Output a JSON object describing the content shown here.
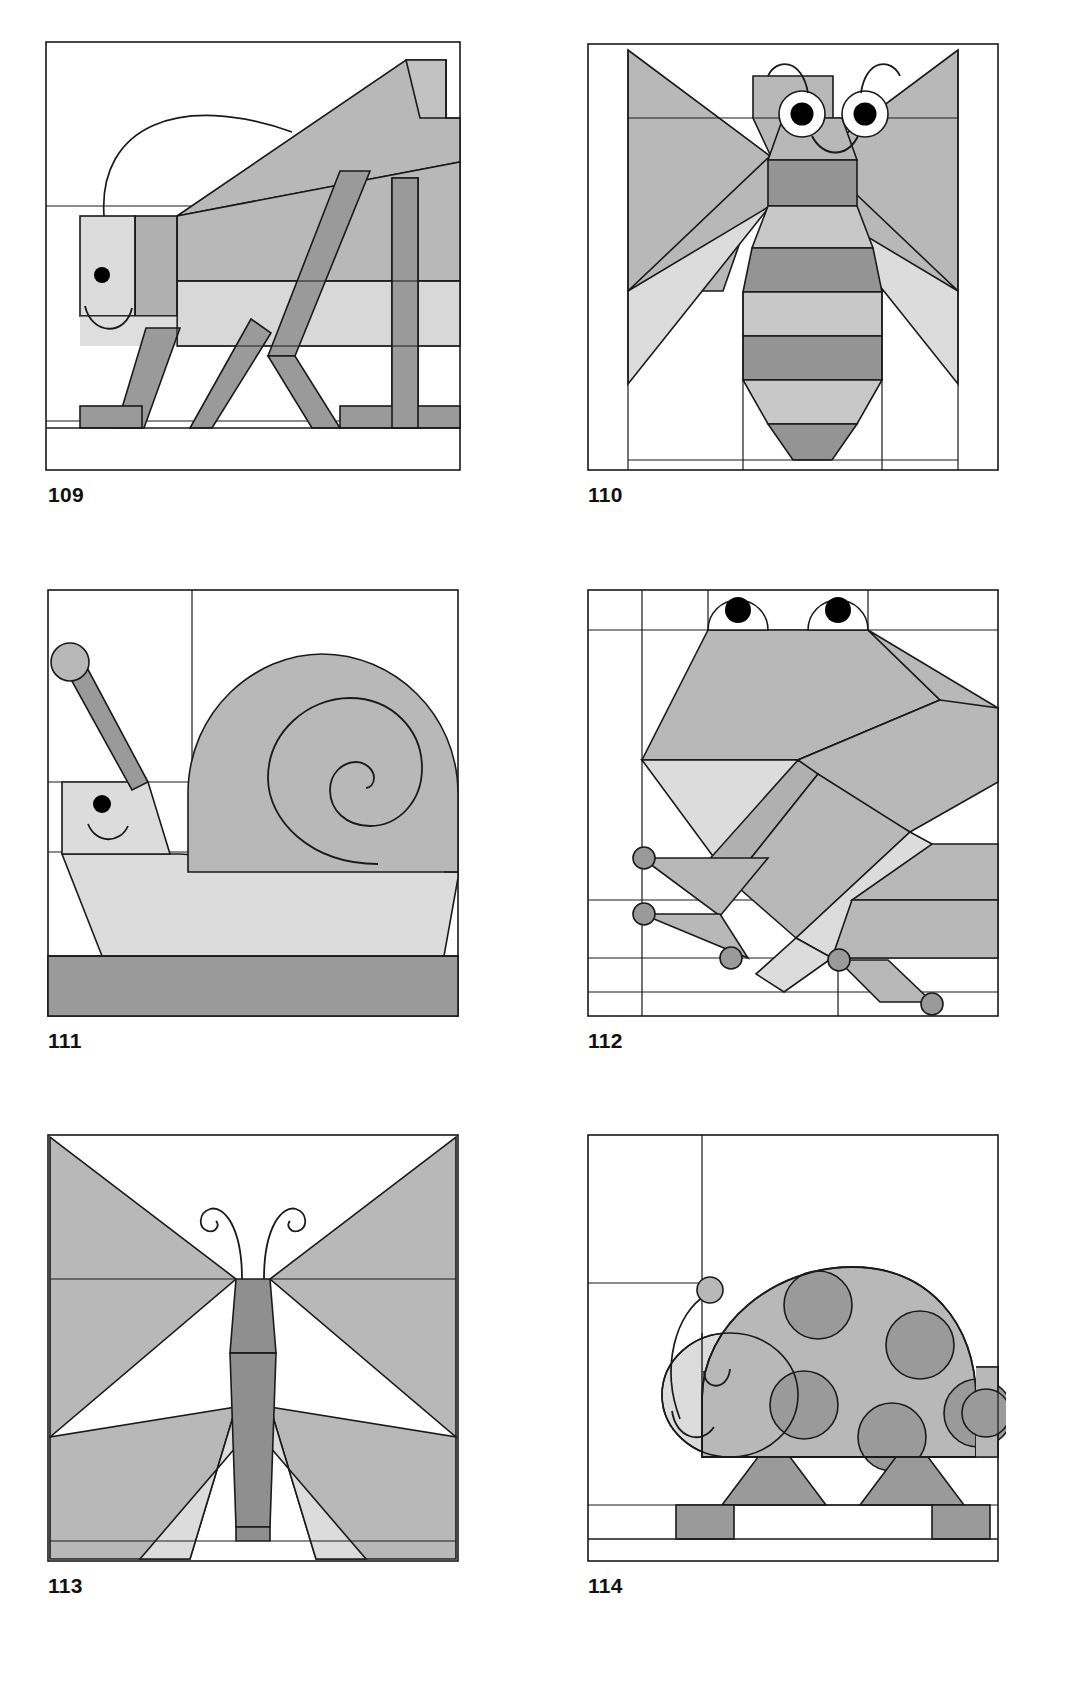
{
  "page": {
    "background": "#ffffff",
    "columns": 2,
    "rows": 3
  },
  "palette": {
    "white": "#ffffff",
    "light": "#e3e3e3",
    "mid": "#b8b8b8",
    "dark": "#939393",
    "outline": "#1a1a1a",
    "pupil": "#000000",
    "text": "#111111"
  },
  "blocks": [
    {
      "number": "109",
      "name": "grasshopper",
      "caption": "109",
      "position": {
        "row": 1,
        "col": 1
      },
      "features": [
        "curved antenna",
        "eye dot",
        "smile",
        "sloped wing",
        "bent hind leg",
        "front legs"
      ]
    },
    {
      "number": "110",
      "name": "bee",
      "caption": "110",
      "position": {
        "row": 1,
        "col": 2
      },
      "features": [
        "two curved antennae",
        "two eyes with pupils",
        "smile",
        "two wings",
        "striped abdomen"
      ]
    },
    {
      "number": "111",
      "name": "snail",
      "caption": "111",
      "position": {
        "row": 2,
        "col": 1
      },
      "features": [
        "eye stalk with ball",
        "eye dot",
        "smile",
        "spiral shell",
        "foot",
        "dark ground strip"
      ]
    },
    {
      "number": "112",
      "name": "frog",
      "caption": "112",
      "position": {
        "row": 2,
        "col": 2
      },
      "features": [
        "two domed eyes with pupils",
        "wide mouth",
        "folded legs",
        "round toe pads"
      ]
    },
    {
      "number": "113",
      "name": "butterfly",
      "caption": "113",
      "position": {
        "row": 3,
        "col": 1
      },
      "features": [
        "two curled antennae",
        "segmented body",
        "upper wings",
        "lower wings"
      ]
    },
    {
      "number": "114",
      "name": "ladybug",
      "caption": "114",
      "position": {
        "row": 3,
        "col": 2
      },
      "features": [
        "curved antenna with ball",
        "closed eye",
        "smile",
        "domed shell with spots",
        "two legs"
      ]
    }
  ]
}
